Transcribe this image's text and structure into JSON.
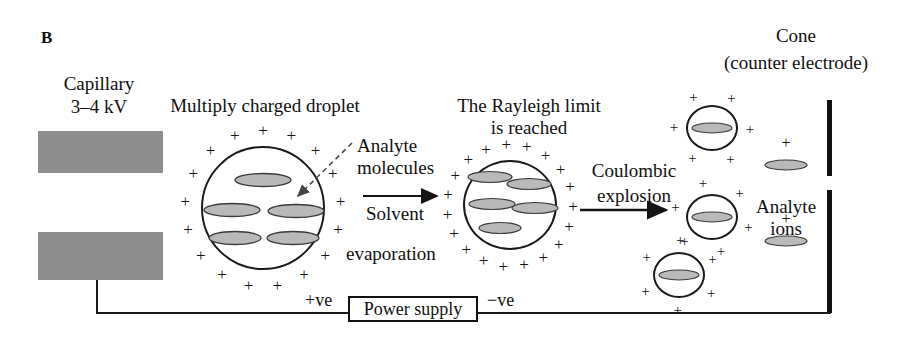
{
  "panel": {
    "letter": "B"
  },
  "labels": {
    "capillary": "Capillary",
    "capillary_voltage": "3–4 kV",
    "multiply_charged_droplet": "Multiply charged droplet",
    "analyte_molecules_line1": "Analyte",
    "analyte_molecules_line2": "molecules",
    "solvent_line1": "Solvent",
    "solvent_line2": "evaporation",
    "rayleigh_line1": "The Rayleigh limit",
    "rayleigh_line2": "is reached",
    "coulombic_line1": "Coulombic",
    "coulombic_line2": "explosion",
    "cone_line1": "Cone",
    "cone_line2": "(counter electrode)",
    "analyte_ions_line1": "Analyte",
    "analyte_ions_line2": "ions",
    "power_supply": "Power supply",
    "positive_terminal": "+ve",
    "negative_terminal": "−ve",
    "charge_symbol": "+"
  },
  "colors": {
    "ink": "#101010",
    "capillary_gray": "#8d8d8d",
    "molecule_fill": "#b9b9b9",
    "molecule_stroke": "#3a3a3a",
    "electrode_black": "#111111",
    "background": "#ffffff"
  },
  "geometry": {
    "capillary_blocks": [
      {
        "x": 38,
        "y": 131,
        "w": 125,
        "h": 42
      },
      {
        "x": 38,
        "y": 232,
        "w": 125,
        "h": 48
      }
    ],
    "droplets": [
      {
        "name": "multiply-charged-droplet",
        "cx": 263,
        "cy": 208,
        "rx": 62,
        "ry": 62,
        "charges": 17,
        "molecules": 5
      },
      {
        "name": "rayleigh-limit-droplet",
        "cx": 510,
        "cy": 205,
        "rx": 47,
        "ry": 45,
        "charges": 19,
        "molecules": 5
      },
      {
        "name": "post-explosion-droplet-top",
        "cx": 712,
        "cy": 128,
        "rx": 26,
        "ry": 23,
        "charges": 6,
        "molecules": 1
      },
      {
        "name": "post-explosion-droplet-middle",
        "cx": 712,
        "cy": 217,
        "rx": 26,
        "ry": 23,
        "charges": 6,
        "molecules": 1
      },
      {
        "name": "post-explosion-droplet-bottom",
        "cx": 679,
        "cy": 275,
        "rx": 26,
        "ry": 23,
        "charges": 6,
        "molecules": 1
      }
    ],
    "free_ions": [
      {
        "name": "analyte-ion-upper",
        "cx": 786,
        "cy": 165,
        "plus_dy": -22
      },
      {
        "name": "analyte-ion-lower",
        "cx": 786,
        "cy": 241,
        "plus_dy": -22
      }
    ],
    "electrodes": [
      {
        "x": 827,
        "y": 100,
        "h": 76
      },
      {
        "x": 827,
        "y": 190,
        "h": 123
      }
    ],
    "power_supply_box": {
      "x": 348,
      "y": 296,
      "w": 130,
      "h": 26
    }
  }
}
